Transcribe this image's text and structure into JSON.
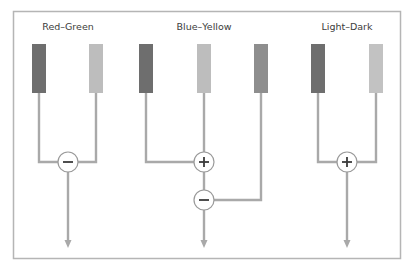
{
  "diagram": {
    "frame_color": "#b5b5b5",
    "wire_color": "#a9a9a9",
    "groups": [
      {
        "label": "Red–Green",
        "label_x": 68,
        "receptors": [
          {
            "x": 39,
            "color": "#6e6e6e"
          },
          {
            "x": 96,
            "color": "#bdbdbd"
          }
        ],
        "operations": [
          {
            "symbol": "−",
            "type": "minus",
            "x": 68,
            "y": 162
          }
        ]
      },
      {
        "label": "Blue–Yellow",
        "label_x": 204,
        "receptors": [
          {
            "x": 146,
            "color": "#6e6e6e"
          },
          {
            "x": 204,
            "color": "#bdbdbd"
          },
          {
            "x": 261,
            "color": "#8e8e8e"
          }
        ],
        "operations": [
          {
            "symbol": "+",
            "type": "plus",
            "x": 204,
            "y": 162
          },
          {
            "symbol": "−",
            "type": "minus",
            "x": 204,
            "y": 200
          }
        ]
      },
      {
        "label": "Light–Dark",
        "label_x": 347,
        "receptors": [
          {
            "x": 318,
            "color": "#6e6e6e"
          },
          {
            "x": 376,
            "color": "#c2c2c2"
          }
        ],
        "operations": [
          {
            "symbol": "+",
            "type": "plus",
            "x": 347,
            "y": 162
          }
        ]
      }
    ]
  }
}
